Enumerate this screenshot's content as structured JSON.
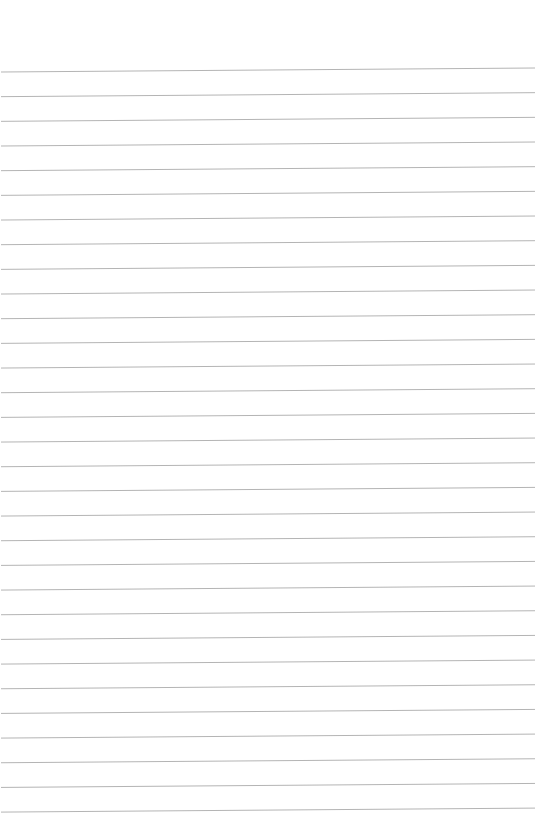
{
  "page": {
    "type": "ruled-paper",
    "background_color": "#ffffff",
    "line_color": "#b4b4b4",
    "line_count": 31,
    "first_line_y": 70,
    "line_spacing": 24.67,
    "line_tilt_px": 4
  }
}
